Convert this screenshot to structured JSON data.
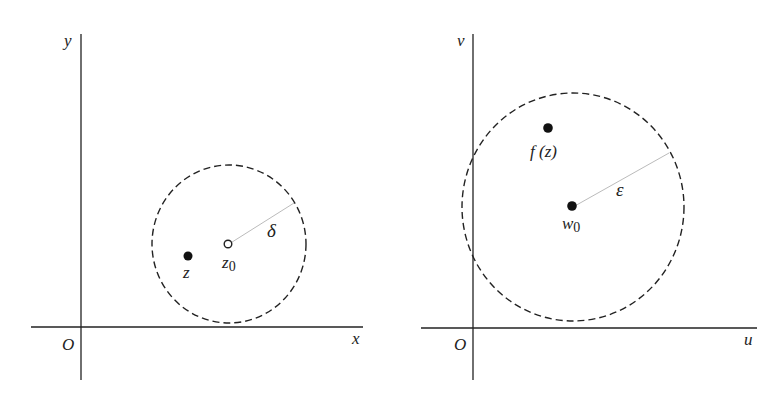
{
  "left_panel": {
    "axes": {
      "x_label": "x",
      "y_label": "y",
      "origin_label": "O"
    },
    "points": {
      "z": {
        "label": "z",
        "style": "filled"
      },
      "z0": {
        "label": "z",
        "subscript": "0",
        "style": "hollow"
      }
    },
    "radius_label": "δ"
  },
  "right_panel": {
    "axes": {
      "x_label": "u",
      "y_label": "v",
      "origin_label": "O"
    },
    "points": {
      "fz": {
        "label": "f (z)",
        "style": "filled"
      },
      "w0": {
        "label": "w",
        "subscript": "0",
        "style": "filled"
      }
    },
    "radius_label": "ε"
  },
  "colors": {
    "ink": "#222222",
    "radius_line": "#bbbbbb",
    "background": "#ffffff"
  }
}
